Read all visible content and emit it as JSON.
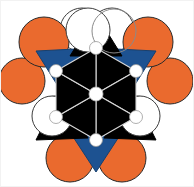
{
  "figure": {
    "kind": "structure-diagram",
    "width": 194,
    "height": 187,
    "background": "#ffffff",
    "border_color": "#f2f2f2"
  },
  "palette": {
    "orange": "#ea6a2e",
    "blue": "#1d5291",
    "black": "#000000",
    "white": "#ffffff",
    "outline_dark": "#4a4a4a",
    "outline_black": "#1a1a1a",
    "edge_light": "#d8d8d8",
    "node_white": "#ffffff"
  },
  "geometry": {
    "center": {
      "x": 96,
      "y": 94
    },
    "hexagon_radius": 46,
    "hexagon_rotation_deg": 0,
    "center_node_radius": 7,
    "vertex_node_radius": 6.5,
    "outer_triangle_offset": 46,
    "sphere_radius_large": 24,
    "sphere_radius_small": 22,
    "hollow_radius": 22
  },
  "elements": {
    "center_hexagon": {
      "name": "central-hexagon",
      "fill": "#000000",
      "edge": "#d8d8d8",
      "triangle_count": 6
    },
    "center_node": {
      "name": "center-node",
      "fill": "#ffffff",
      "stroke": "#bdbdbd"
    },
    "vertex_nodes": {
      "name": "hexagon-vertex-node",
      "count": 6,
      "fill": "#ffffff",
      "stroke": "#9a9a9a"
    },
    "blue_triangles": [
      {
        "name": "blue-triangle-upper-left",
        "position": "upper-left",
        "fill": "#1d5291",
        "angle_deg": 210
      },
      {
        "name": "blue-triangle-upper-right",
        "position": "upper-right",
        "fill": "#1d5291",
        "angle_deg": 330
      },
      {
        "name": "blue-triangle-bottom",
        "position": "bottom",
        "fill": "#1d5291",
        "angle_deg": 90
      }
    ],
    "black_triangles": [
      {
        "name": "black-triangle-top",
        "position": "top",
        "fill": "#000000",
        "angle_deg": 270
      },
      {
        "name": "black-triangle-lower-left",
        "position": "lower-left",
        "fill": "#000000",
        "angle_deg": 150
      },
      {
        "name": "black-triangle-lower-right",
        "position": "lower-right",
        "fill": "#000000",
        "angle_deg": 30
      }
    ],
    "orange_spheres": [
      {
        "name": "orange-sphere-top-left",
        "cx": 44,
        "cy": 42,
        "r": 25
      },
      {
        "name": "orange-sphere-top-right",
        "cx": 148,
        "cy": 42,
        "r": 25
      },
      {
        "name": "orange-sphere-left",
        "cx": 22,
        "cy": 81,
        "r": 23
      },
      {
        "name": "orange-sphere-right",
        "cx": 170,
        "cy": 81,
        "r": 23
      },
      {
        "name": "orange-sphere-bottom-left",
        "cx": 70,
        "cy": 158,
        "r": 24
      },
      {
        "name": "orange-sphere-bottom-right",
        "cx": 122,
        "cy": 158,
        "r": 24
      }
    ],
    "hollow_spheres": [
      {
        "name": "hollow-sphere-top-left",
        "cx": 82,
        "cy": 30,
        "r": 22
      },
      {
        "name": "hollow-sphere-top-right",
        "cx": 112,
        "cy": 30,
        "r": 22
      },
      {
        "name": "hollow-sphere-lower-left",
        "cx": 56,
        "cy": 117,
        "r": 21
      },
      {
        "name": "hollow-sphere-lower-right",
        "cx": 136,
        "cy": 117,
        "r": 21
      }
    ]
  },
  "legend": {
    "orange_label": "orange atom",
    "blue_label": "blue polyhedron",
    "black_label": "black polyhedron",
    "white_label": "white atom"
  }
}
